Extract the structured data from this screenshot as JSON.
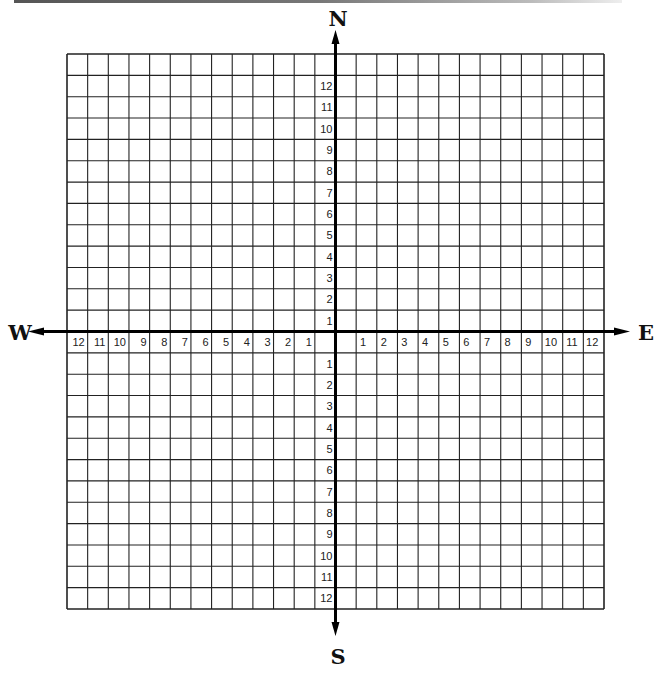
{
  "diagram": {
    "type": "coordinate-grid-compass",
    "directions": {
      "north": "N",
      "south": "S",
      "east": "E",
      "west": "W"
    },
    "grid": {
      "columns": 26,
      "rows": 26
    },
    "axis_labels": {
      "west": [
        "12",
        "11",
        "10",
        "9",
        "8",
        "7",
        "6",
        "5",
        "4",
        "3",
        "2",
        "1"
      ],
      "east": [
        "1",
        "2",
        "3",
        "4",
        "5",
        "6",
        "7",
        "8",
        "9",
        "10",
        "11",
        "12"
      ],
      "north": [
        "12",
        "11",
        "10",
        "9",
        "8",
        "7",
        "6",
        "5",
        "4",
        "3",
        "2",
        "1"
      ],
      "south": [
        "1",
        "2",
        "3",
        "4",
        "5",
        "6",
        "7",
        "8",
        "9",
        "10",
        "11",
        "12"
      ]
    },
    "colors": {
      "line": "#222222",
      "axis": "#000000",
      "background": "#ffffff"
    }
  }
}
